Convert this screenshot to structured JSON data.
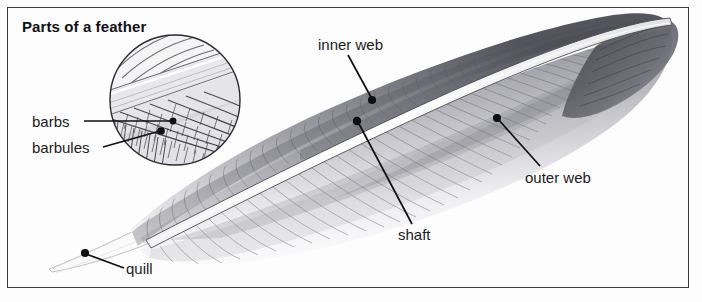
{
  "figure": {
    "title": "Parts of a feather",
    "width": 702,
    "height": 302,
    "background_color": "#fdfdfd",
    "frame_color": "#3a3a42",
    "label_color": "#1b1b20"
  },
  "labels": [
    {
      "id": "inner-web",
      "text": "inner web",
      "x": 318,
      "y": 36,
      "leader_to_x": 372,
      "leader_to_y": 100
    },
    {
      "id": "outer-web",
      "text": "outer web",
      "x": 525,
      "y": 169,
      "leader_to_x": 497,
      "leader_to_y": 118
    },
    {
      "id": "shaft",
      "text": "shaft",
      "x": 398,
      "y": 226,
      "leader_to_x": 357,
      "leader_to_y": 121
    },
    {
      "id": "quill",
      "text": "quill",
      "x": 126,
      "y": 260,
      "leader_to_x": 85,
      "leader_to_y": 253
    },
    {
      "id": "barbs",
      "text": "barbs",
      "x": 32,
      "y": 113,
      "leader_to_x": 152,
      "leader_to_y": 122
    },
    {
      "id": "barbules",
      "text": "barbules",
      "x": 32,
      "y": 139,
      "leader_to_x": 152,
      "leader_to_y": 133
    }
  ],
  "inset": {
    "name": "magnified-detail-circle",
    "center_x": 175,
    "center_y": 100,
    "radius": 66,
    "shows": "barbs and barbules interlocking along the shaft"
  },
  "feather": {
    "tip_x": 672,
    "tip_y": 26,
    "quill_tip_x": 48,
    "quill_tip_y": 268,
    "shaft_color": "#ffffff",
    "vane_color": "#8d8d93"
  }
}
